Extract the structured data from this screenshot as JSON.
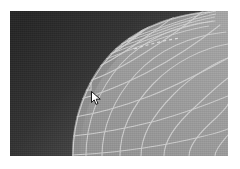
{
  "app": {
    "view_name": "mesh-viewport",
    "view_kind": "structured-grid-visualization",
    "color_mode": "grayscale"
  },
  "colors": {
    "page_background": "#ffffff",
    "viewport_background": "#9d9d9d",
    "surface_fill_light": "#a6a6a6",
    "surface_fill_mid": "#999999",
    "surface_fill_dark": "#8e8e8e",
    "gridline": "#cfcfcf",
    "gridline_bright": "#e2e2e2",
    "dark_region_near": "#2c2c2c",
    "dark_region_far": "#4e4e4e",
    "dark_region_edge": "#6f6f6f",
    "cursor_fill": "#ffffff",
    "cursor_outline": "#1a1a1a",
    "vertex_marker": "#d8d8d8"
  },
  "viewport": {
    "x": 10,
    "y": 11,
    "width": 218,
    "height": 145
  },
  "regions": [
    {
      "name": "background-dark-field",
      "description": "dark shaded field occupying the upper-left and left edge, bounded by a convex curve",
      "label": ""
    },
    {
      "name": "meshed-surface",
      "description": "light grey surface covered by a curvilinear structured quad mesh",
      "label": ""
    }
  ],
  "mesh": {
    "style": "structured-quad",
    "radial_line_count": 9,
    "circumferential_line_count": 9,
    "clustered_band_line_count": 5,
    "line_width": 1.1,
    "has_dashed_annotation": true
  },
  "annotation": {
    "name": "dashed-segment",
    "style": "dashed",
    "label": ""
  },
  "cursor": {
    "name": "arrow-pointer",
    "x": 91,
    "y": 91,
    "shape": "arrow"
  },
  "vertex_marker": {
    "name": "selected-vertex",
    "x": 87,
    "y": 86,
    "size": 7
  },
  "labels": {
    "caption": "",
    "title": ""
  }
}
